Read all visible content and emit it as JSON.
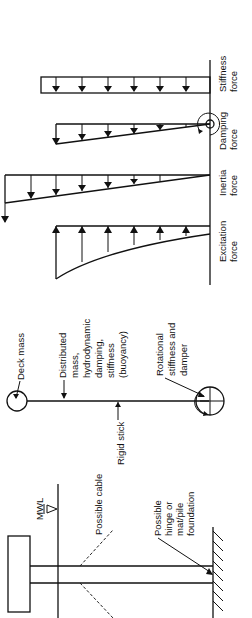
{
  "figure": {
    "orientation": "rotated-90-ccw",
    "structure_panel": {
      "labels": {
        "mwl": "MWL",
        "possible_cable": "Possible cable",
        "possible_hinge": [
          "Possible",
          "hinge or",
          "mat/pile",
          "foundation"
        ]
      }
    },
    "model_panel": {
      "labels": {
        "deck_mass": "Deck mass",
        "distributed": [
          "Distributed",
          "mass,",
          "hydrodynamic",
          "damping,",
          "stiffness",
          "(buoyancy)"
        ],
        "rigid_stick": "Rigid stick",
        "rotational": [
          "Rotational",
          "stiffness and",
          "damper"
        ]
      }
    },
    "force_panel": {
      "diagrams": [
        {
          "label": [
            "Excitation",
            "force"
          ],
          "shape": "curved",
          "arrow_direction": "up"
        },
        {
          "label": [
            "Inertia",
            "force"
          ],
          "shape": "triangular",
          "arrow_direction": "down"
        },
        {
          "label": [
            "Damping",
            "force"
          ],
          "shape": "triangular",
          "arrow_direction": "down"
        },
        {
          "label": [
            "Stiffness",
            "force"
          ],
          "shape": "rectangular",
          "arrow_direction": "down"
        }
      ]
    }
  }
}
